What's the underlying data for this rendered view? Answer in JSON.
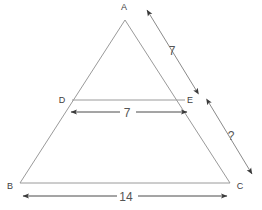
{
  "figure": {
    "type": "geometry-diagram",
    "shape": "triangle-with-midsegment",
    "background_color": "#ffffff",
    "line_color": "#9a9a9a",
    "dimension_color": "#4a4a4a",
    "label_color": "#404040"
  },
  "vertices": [
    {
      "id": "A",
      "label": "A",
      "x": 125,
      "y": 20,
      "label_x": 124,
      "label_y": 10
    },
    {
      "id": "B",
      "label": "B",
      "x": 20,
      "y": 183,
      "label_x": 10,
      "label_y": 189
    },
    {
      "id": "C",
      "label": "C",
      "x": 230,
      "y": 183,
      "label_x": 240,
      "label_y": 189
    },
    {
      "id": "D",
      "label": "D",
      "x": 72,
      "y": 100,
      "label_x": 62,
      "label_y": 103
    },
    {
      "id": "E",
      "label": "E",
      "x": 185,
      "y": 100,
      "label_x": 190,
      "label_y": 103
    }
  ],
  "segments": [
    {
      "name": "AB",
      "from": "A",
      "to": "B"
    },
    {
      "name": "AC",
      "from": "A",
      "to": "C"
    },
    {
      "name": "BC",
      "from": "B",
      "to": "C"
    },
    {
      "name": "DE",
      "from": "D",
      "to": "E"
    }
  ],
  "measurements": [
    {
      "id": "ae",
      "label": "7",
      "describes": "AE",
      "label_x": 172,
      "label_y": 55,
      "arrow": {
        "x1": 196,
        "y1": 90,
        "x2": 147,
        "y2": 10,
        "double": true
      }
    },
    {
      "id": "de",
      "label": "7",
      "describes": "DE",
      "label_x": 127,
      "label_y": 117,
      "arrow": {
        "x1": 71,
        "y1": 112,
        "x2": 187,
        "y2": 112,
        "double": true
      }
    },
    {
      "id": "ec",
      "label": "?",
      "describes": "EC",
      "label_x": 231,
      "label_y": 140,
      "arrow": {
        "x1": 209,
        "y1": 103,
        "x2": 252,
        "y2": 174,
        "double": true
      }
    },
    {
      "id": "bc",
      "label": "14",
      "describes": "BC",
      "label_x": 126,
      "label_y": 201,
      "arrow": {
        "x1": 23,
        "y1": 196,
        "x2": 227,
        "y2": 196,
        "double": true
      }
    }
  ]
}
